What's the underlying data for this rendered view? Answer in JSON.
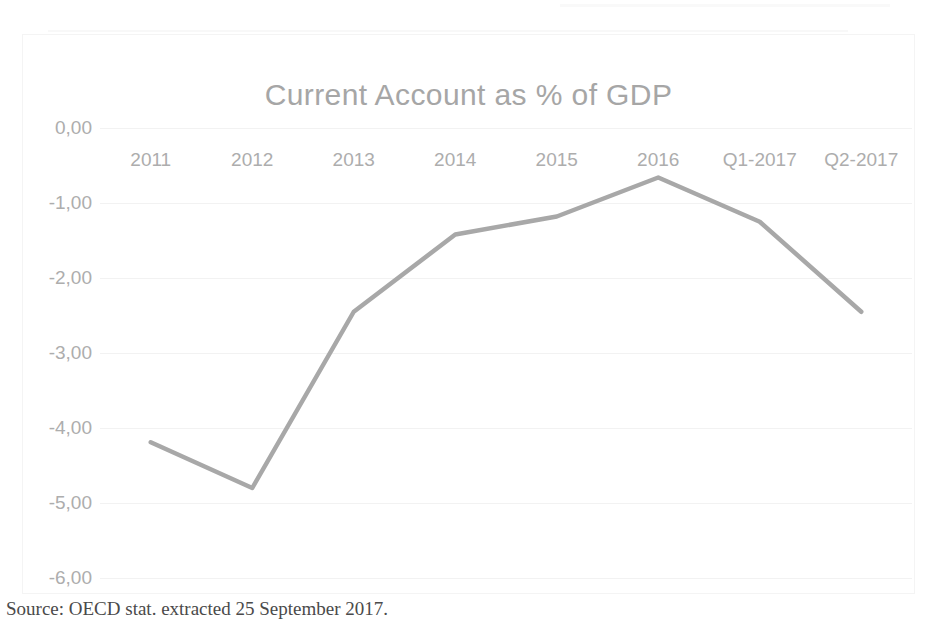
{
  "chart_data": {
    "type": "line",
    "title": "Current Account as % of GDP",
    "xlabel": "",
    "ylabel": "",
    "categories": [
      "2011",
      "2012",
      "2013",
      "2014",
      "2015",
      "2016",
      "Q1-2017",
      "Q2-2017"
    ],
    "values": [
      -4.19,
      -4.8,
      -2.45,
      -1.42,
      -1.18,
      -0.66,
      -1.25,
      -2.45
    ],
    "series": [
      {
        "name": "Current Account as % of GDP",
        "values": [
          -4.19,
          -4.8,
          -2.45,
          -1.42,
          -1.18,
          -0.66,
          -1.25,
          -2.45
        ]
      }
    ],
    "ylim": [
      -6.0,
      0.0
    ],
    "ytick_labels": [
      "0,00",
      "-1,00",
      "-2,00",
      "-3,00",
      "-4,00",
      "-5,00",
      "-6,00"
    ],
    "ytick_values": [
      0,
      -1,
      -2,
      -3,
      -4,
      -5,
      -6
    ],
    "grid": true,
    "legend": "none",
    "line_color": "#a8a8a8",
    "text_color": "#adadad",
    "title_color": "#a6a6a6",
    "grid_color": "#f2f2f2"
  },
  "source": {
    "text": "Source: OECD stat. extracted 25 September 2017."
  }
}
